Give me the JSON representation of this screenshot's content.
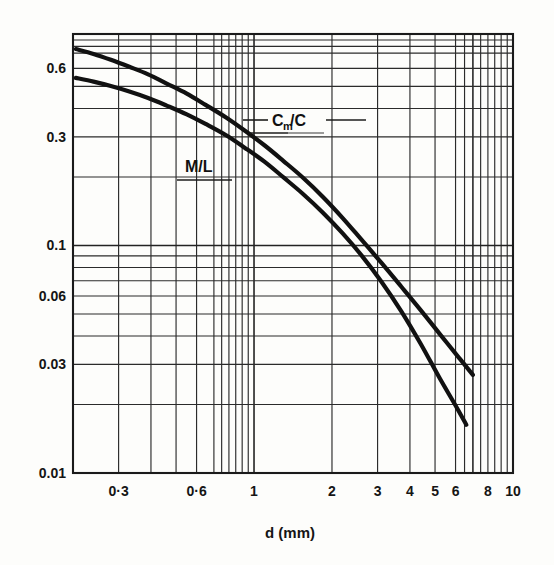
{
  "figure": {
    "background_color": "#fdfdfb",
    "ink_color": "#111111"
  },
  "chart_data": {
    "type": "line",
    "title": "",
    "subtitle": "",
    "xlabel": "d (mm)",
    "ylabel": "",
    "xscale": "log",
    "yscale": "log",
    "xlim": [
      0.2,
      10
    ],
    "ylim": [
      0.01,
      0.85
    ],
    "grid": true,
    "grid_style": "log-log minor and major gridlines",
    "legend_position": "inline annotations on plot",
    "x_tick_labels": [
      "0·3",
      "0·6",
      "1",
      "2",
      "3",
      "4",
      "5",
      "6",
      "8",
      "10"
    ],
    "x_tick_values": [
      0.3,
      0.6,
      1,
      2,
      3,
      4,
      5,
      6,
      8,
      10
    ],
    "y_tick_labels": [
      "0.6",
      "0.3",
      "0.1",
      "0.06",
      "0.03",
      "0.01"
    ],
    "y_tick_values": [
      0.6,
      0.3,
      0.1,
      0.06,
      0.03,
      0.01
    ],
    "annotations": [
      {
        "text": "C",
        "sub": "m",
        "text2": "/C",
        "full": "Cm/C",
        "x": 1.0,
        "y": 0.38
      },
      {
        "text": "M/L",
        "full": "M/L",
        "x": 0.52,
        "y": 0.23
      }
    ],
    "series": [
      {
        "name": "Cm/C",
        "label": "Cm/C",
        "color": "#111111",
        "x": [
          0.205,
          0.24,
          0.28,
          0.33,
          0.39,
          0.46,
          0.55,
          0.65,
          0.78,
          0.92,
          1.1,
          1.3,
          1.55,
          1.85,
          2.2,
          2.6,
          3.1,
          3.7,
          4.4,
          5.2,
          6.2,
          7.0
        ],
        "y": [
          0.73,
          0.695,
          0.655,
          0.61,
          0.565,
          0.515,
          0.465,
          0.415,
          0.365,
          0.32,
          0.275,
          0.235,
          0.198,
          0.163,
          0.132,
          0.106,
          0.084,
          0.066,
          0.052,
          0.041,
          0.032,
          0.027
        ]
      },
      {
        "name": "M/L",
        "label": "M/L",
        "color": "#111111",
        "x": [
          0.205,
          0.24,
          0.28,
          0.33,
          0.39,
          0.46,
          0.55,
          0.65,
          0.78,
          0.92,
          1.1,
          1.3,
          1.55,
          1.85,
          2.2,
          2.6,
          3.1,
          3.7,
          4.4,
          5.2,
          6.0,
          6.6
        ],
        "y": [
          0.545,
          0.525,
          0.502,
          0.475,
          0.445,
          0.412,
          0.377,
          0.342,
          0.305,
          0.269,
          0.233,
          0.199,
          0.168,
          0.139,
          0.113,
          0.0905,
          0.0695,
          0.0515,
          0.037,
          0.0262,
          0.0198,
          0.0163
        ]
      }
    ]
  }
}
